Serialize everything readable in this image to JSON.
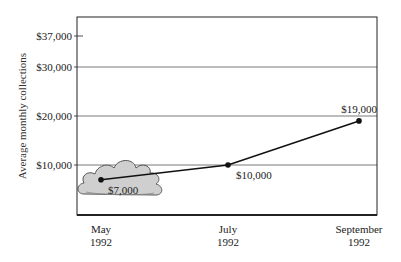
{
  "chart_data": {
    "type": "line",
    "title": "",
    "xlabel": "",
    "ylabel": "Average monthly collections",
    "ylim": [
      0,
      37000
    ],
    "grid": true,
    "categories": [
      "May 1992",
      "July 1992",
      "September 1992"
    ],
    "category_lines": [
      [
        "May",
        "1992"
      ],
      [
        "July",
        "1992"
      ],
      [
        "September",
        "1992"
      ]
    ],
    "series": [
      {
        "name": "Average monthly collections",
        "values": [
          7000,
          10000,
          19000
        ]
      }
    ],
    "data_labels": [
      "$7,000",
      "$10,000",
      "$19,000"
    ],
    "y_ticks": [
      {
        "value": 10000,
        "label": "$10,000",
        "gridline": true
      },
      {
        "value": 20000,
        "label": "$20,000",
        "gridline": true
      },
      {
        "value": 30000,
        "label": "$30,000",
        "gridline": true
      },
      {
        "value": 37000,
        "label": "$37,000",
        "gridline": false
      }
    ],
    "annotations": [
      {
        "type": "cloud-icon",
        "attached_to": "May 1992"
      }
    ]
  },
  "colors": {
    "line": "#111111",
    "grid": "#555555",
    "axis": "#222222",
    "cloud_fill": "#cfcfcf",
    "cloud_stroke": "#555555"
  }
}
